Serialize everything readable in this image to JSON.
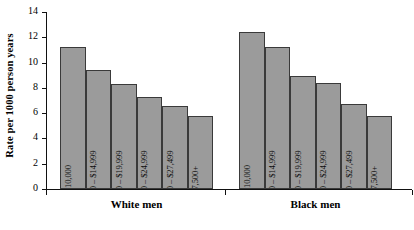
{
  "chart_data": {
    "type": "bar",
    "title": "",
    "xlabel": "",
    "ylabel": "Rate per 1000 person years",
    "ylim": [
      0,
      14
    ],
    "ytick_values": [
      0,
      2,
      4,
      6,
      8,
      10,
      12,
      14
    ],
    "ytick_labels": [
      "0",
      "2",
      "4",
      "6",
      "8",
      "10",
      "12",
      "14"
    ],
    "grid": false,
    "legend": "none",
    "categories": [
      "< $10,000",
      "$10,000 – $14,999",
      "$15,000 – $19,999",
      "$20,000 – $24,999",
      "$25,000 – $27,499",
      "$27,500+"
    ],
    "groups": [
      "White men",
      "Black men"
    ],
    "series": [
      {
        "name": "White men",
        "values": [
          11.2,
          9.4,
          8.3,
          7.3,
          6.6,
          5.8
        ]
      },
      {
        "name": "Black men",
        "values": [
          12.4,
          11.2,
          8.9,
          8.4,
          6.7,
          5.8
        ]
      }
    ],
    "bar_fill_color": "#9b9b9b",
    "bar_border_color": "#3a3a3a",
    "axis_color": "#111111"
  }
}
